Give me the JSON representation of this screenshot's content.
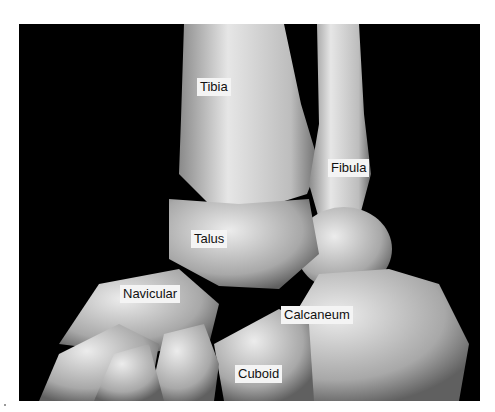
{
  "figure": {
    "background_color": "#000000",
    "bone_color": "#c8c8c8",
    "labels": [
      {
        "id": "tibia",
        "text": "Tibia",
        "x": 197,
        "y": 78
      },
      {
        "id": "fibula",
        "text": "Fibula",
        "x": 328,
        "y": 159
      },
      {
        "id": "talus",
        "text": "Talus",
        "x": 191,
        "y": 230
      },
      {
        "id": "navicular",
        "text": "Navicular",
        "x": 120,
        "y": 285
      },
      {
        "id": "calcaneum",
        "text": "Calcaneum",
        "x": 281,
        "y": 306
      },
      {
        "id": "cuboid",
        "text": "Cuboid",
        "x": 235,
        "y": 365
      }
    ]
  }
}
